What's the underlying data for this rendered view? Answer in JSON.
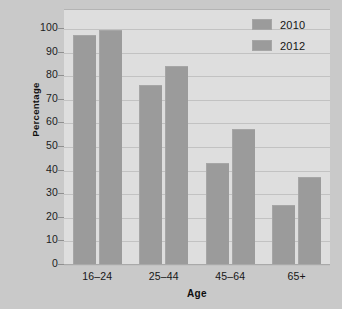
{
  "chart_data": {
    "type": "bar",
    "title": "",
    "xlabel": "Age",
    "ylabel": "Percentage",
    "categories": [
      "16–24",
      "25–44",
      "45–64",
      "65+"
    ],
    "series": [
      {
        "name": "2010",
        "values": [
          97,
          76,
          43,
          25
        ],
        "color": "#9b9b9b"
      },
      {
        "name": "2012",
        "values": [
          99,
          84,
          57,
          37
        ],
        "color": "#9b9b9b"
      }
    ],
    "ylim": [
      0,
      100
    ],
    "ytick_labels": [
      "100",
      "90",
      "80",
      "70",
      "60",
      "50",
      "40",
      "30",
      "20",
      "10",
      "0"
    ],
    "ytick_values": [
      100,
      90,
      80,
      70,
      60,
      50,
      40,
      30,
      20,
      10,
      0
    ],
    "grid": true,
    "legend_position": "top-right",
    "legend_entries": [
      "2010",
      "2012"
    ],
    "plot_background": "#dedede",
    "figure_background": "#c9c9c9"
  }
}
